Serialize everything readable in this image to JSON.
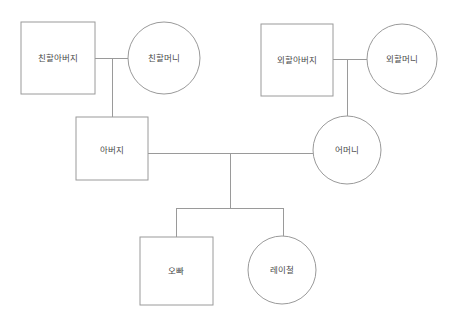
{
  "diagram": {
    "type": "genogram",
    "title": "",
    "canvas": {
      "width": 454,
      "height": 328,
      "background": "#ffffff"
    },
    "colors": {
      "stroke": "#9a9a9a",
      "shape_fill": "#ffffff",
      "text": "#4a4a4a"
    },
    "nodes": [
      {
        "id": "paternal-grandfather",
        "label": "친할아버지",
        "shape": "square",
        "gender": "male",
        "generation": 1,
        "x": 21,
        "y": 22,
        "w": 74,
        "h": 72,
        "cx": 58,
        "cy": 58
      },
      {
        "id": "paternal-grandmother",
        "label": "친할머니",
        "shape": "circle",
        "gender": "female",
        "generation": 1,
        "cx": 164,
        "cy": 58,
        "r": 36
      },
      {
        "id": "maternal-grandfather",
        "label": "외할아버지",
        "shape": "square",
        "gender": "male",
        "generation": 1,
        "x": 261,
        "y": 24,
        "w": 72,
        "h": 72,
        "cx": 297,
        "cy": 60
      },
      {
        "id": "maternal-grandmother",
        "label": "외할머니",
        "shape": "circle",
        "gender": "female",
        "generation": 1,
        "cx": 402,
        "cy": 59,
        "r": 35
      },
      {
        "id": "father",
        "label": "아버지",
        "shape": "square",
        "gender": "male",
        "generation": 2,
        "x": 76,
        "y": 117,
        "w": 72,
        "h": 63,
        "cx": 112,
        "cy": 150
      },
      {
        "id": "mother",
        "label": "어머니",
        "shape": "circle",
        "gender": "female",
        "generation": 2,
        "cx": 347,
        "cy": 150,
        "r": 34
      },
      {
        "id": "brother",
        "label": "오빠",
        "shape": "square",
        "gender": "male",
        "generation": 3,
        "x": 140,
        "y": 237,
        "w": 73,
        "h": 68,
        "cx": 176,
        "cy": 271
      },
      {
        "id": "self",
        "label": "레이철",
        "shape": "circle",
        "gender": "female",
        "generation": 3,
        "cx": 282,
        "cy": 270,
        "r": 34
      }
    ],
    "links": [
      {
        "id": "marriage-paternal",
        "kind": "marriage",
        "from": "paternal-grandfather",
        "to": "paternal-grandmother",
        "path": "M95,58 L128,58"
      },
      {
        "id": "descent-paternal",
        "kind": "descent",
        "from": "marriage-paternal",
        "to": "father",
        "path": "M112,58 L112,117"
      },
      {
        "id": "marriage-maternal",
        "kind": "marriage",
        "from": "maternal-grandfather",
        "to": "maternal-grandmother",
        "path": "M333,59 L367,59"
      },
      {
        "id": "descent-maternal",
        "kind": "descent",
        "from": "marriage-maternal",
        "to": "mother",
        "path": "M347,59 L347,116"
      },
      {
        "id": "marriage-parents",
        "kind": "marriage",
        "from": "father",
        "to": "mother",
        "path": "M148,153 L313,153"
      },
      {
        "id": "descent-parents",
        "kind": "descent",
        "from": "marriage-parents",
        "to": "sibling-bar",
        "path": "M230,153 L230,208"
      },
      {
        "id": "sibling-bar",
        "kind": "sibling-bar",
        "path": "M176,208 L283,208"
      },
      {
        "id": "descent-brother",
        "kind": "descent",
        "from": "sibling-bar",
        "to": "brother",
        "path": "M176,208 L176,237"
      },
      {
        "id": "descent-self",
        "kind": "descent",
        "from": "sibling-bar",
        "to": "self",
        "path": "M283,208 L283,236"
      }
    ]
  }
}
